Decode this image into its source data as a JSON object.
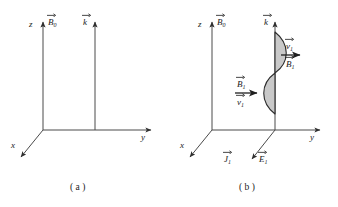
{
  "figure": {
    "panels": [
      {
        "id": "a",
        "caption": "( a )",
        "axes": {
          "z": "z",
          "y": "y",
          "x": "x"
        },
        "vectors": [
          {
            "name": "B0",
            "base": "B",
            "sub": "0",
            "direction": "up"
          },
          {
            "name": "k",
            "base": "k",
            "sub": "",
            "direction": "up"
          }
        ]
      },
      {
        "id": "b",
        "caption": "( b )",
        "axes": {
          "z": "z",
          "y": "y",
          "x": "x"
        },
        "vectors": [
          {
            "name": "B0",
            "base": "B",
            "sub": "0",
            "direction": "up"
          },
          {
            "name": "k",
            "base": "k",
            "sub": "",
            "direction": "up"
          },
          {
            "name": "v1-upper",
            "base": "v",
            "sub": "1",
            "direction": "right"
          },
          {
            "name": "B1-upper",
            "base": "B",
            "sub": "1",
            "direction": "right"
          },
          {
            "name": "B1-lower",
            "base": "B",
            "sub": "1",
            "direction": "right"
          },
          {
            "name": "v1-lower",
            "base": "v",
            "sub": "1",
            "direction": "right"
          },
          {
            "name": "J1",
            "base": "J",
            "sub": "1",
            "direction": "down-left"
          },
          {
            "name": "E1",
            "base": "E",
            "sub": "1",
            "direction": "down-left"
          }
        ],
        "wave": {
          "label": "transverse-wave-envelope",
          "fill_color": "#c9c9c9",
          "stroke_color": "#2b2b2b"
        }
      }
    ],
    "style": {
      "axis_color": "#3c3c3c",
      "background": "#ffffff"
    }
  }
}
